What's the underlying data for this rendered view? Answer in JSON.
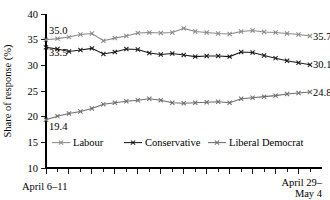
{
  "chart_data": {
    "type": "line",
    "title": "",
    "xlabel": "",
    "ylabel": "Share of response (%)",
    "ylim": [
      10,
      40
    ],
    "yticks": [
      10,
      15,
      20,
      25,
      30,
      35,
      40
    ],
    "ytick_labels": [
      "10",
      "15",
      "20",
      "25",
      "30",
      "35",
      "40"
    ],
    "grid": false,
    "legend_position": "inside-bottom",
    "x_axis_labels": {
      "start": "April 6–11",
      "end_line1": "April 29–",
      "end_line2": "May 4"
    },
    "n_points": 24,
    "x": [
      1,
      2,
      3,
      4,
      5,
      6,
      7,
      8,
      9,
      10,
      11,
      12,
      13,
      14,
      15,
      16,
      17,
      18,
      19,
      20,
      21,
      22,
      23,
      24
    ],
    "series": [
      {
        "name": "Labour",
        "color": "#8a8a8a",
        "marker": "x",
        "values": [
          35.0,
          35.2,
          35.5,
          36.0,
          36.2,
          34.8,
          35.3,
          35.7,
          36.3,
          36.4,
          36.3,
          36.4,
          37.2,
          36.6,
          36.4,
          36.2,
          36.1,
          36.6,
          36.8,
          36.5,
          36.4,
          36.2,
          36.0,
          35.7
        ],
        "start_label": "35.0",
        "end_label": "35.7"
      },
      {
        "name": "Conservative",
        "color": "#1a1a1a",
        "marker": "x",
        "values": [
          33.5,
          33.2,
          32.7,
          33.0,
          33.3,
          32.2,
          32.6,
          33.2,
          33.1,
          32.4,
          32.1,
          32.3,
          32.0,
          31.7,
          31.8,
          31.8,
          31.7,
          32.6,
          32.5,
          31.9,
          31.4,
          30.9,
          30.5,
          30.1
        ],
        "start_label": "33.5",
        "end_label": "30.1"
      },
      {
        "name": "Liberal Democrat",
        "color": "#6e6e6e",
        "marker": "x",
        "values": [
          19.4,
          20.1,
          20.6,
          21.0,
          21.6,
          22.4,
          22.7,
          23.0,
          23.2,
          23.5,
          23.2,
          22.7,
          22.6,
          22.7,
          22.8,
          22.9,
          22.7,
          23.5,
          23.7,
          23.9,
          24.1,
          24.4,
          24.6,
          24.8
        ],
        "start_label": "19.4",
        "end_label": "24.8"
      }
    ],
    "legend": [
      {
        "label": "Labour",
        "color": "#8a8a8a"
      },
      {
        "label": "Conservative",
        "color": "#1a1a1a"
      },
      {
        "label": "Liberal Democrat",
        "color": "#6e6e6e"
      }
    ]
  }
}
